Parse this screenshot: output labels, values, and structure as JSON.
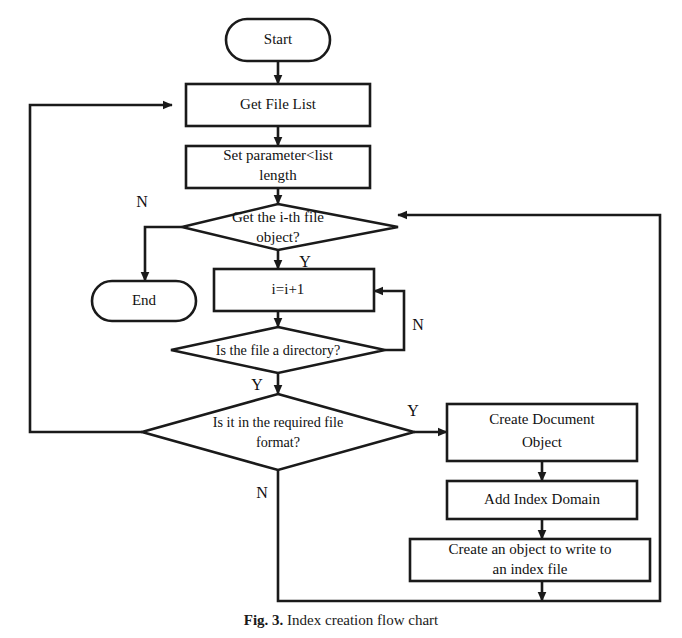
{
  "figure": {
    "caption_prefix": "Fig. 3.",
    "caption_text": "Index creation flow chart",
    "background_color": "#ffffff",
    "line_color": "#1a1a1a"
  },
  "nodes": {
    "start": {
      "label": "Start",
      "shape": "terminator"
    },
    "get_file_list": {
      "label": "Get File List",
      "shape": "process"
    },
    "set_parameter": {
      "label_line1": "Set parameter<list",
      "label_line2": "length",
      "shape": "process"
    },
    "get_ith_file": {
      "label_line1": "Get the i-th file",
      "label_line2": "object?",
      "shape": "decision"
    },
    "end": {
      "label": "End",
      "shape": "terminator"
    },
    "increment": {
      "label": "i=i+1",
      "shape": "process"
    },
    "is_directory": {
      "label": "Is the file a directory?",
      "shape": "decision"
    },
    "is_required_format": {
      "label_line1": "Is it in the required file",
      "label_line2": "format?",
      "shape": "decision"
    },
    "create_document_object": {
      "label_line1": "Create Document",
      "label_line2": "Object",
      "shape": "process"
    },
    "add_index_domain": {
      "label": "Add Index Domain",
      "shape": "process"
    },
    "create_write_object": {
      "label_line1": "Create an object to write to",
      "label_line2": "an index file",
      "shape": "process"
    }
  },
  "branch_labels": {
    "get_ith_file_no": "N",
    "get_ith_file_yes": "Y",
    "is_directory_no": "N",
    "is_directory_yes": "Y",
    "is_required_format_yes": "Y",
    "is_required_format_no": "N"
  }
}
